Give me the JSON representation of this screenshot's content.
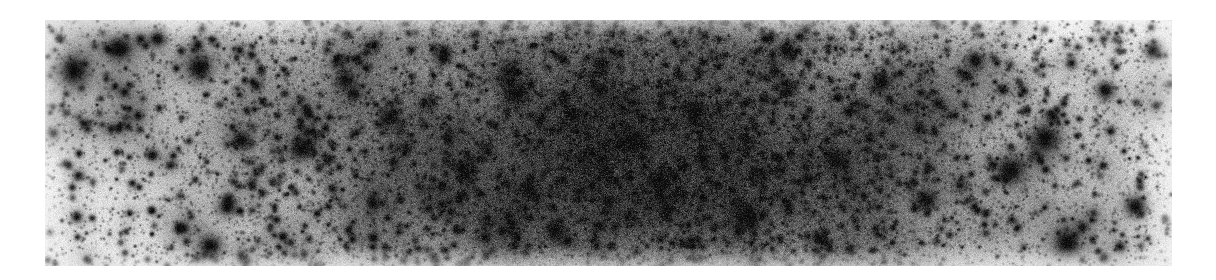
{
  "page": {
    "background_color": "#ffffff",
    "width": 1216,
    "height": 280
  },
  "figure": {
    "name": "dense-star-field-cutout",
    "description": "Inverted greyscale astronomical image of a dense stellar field (globular cluster / crowded Milky Way field). Dark points on a light background.",
    "frame": {
      "x": 45,
      "y": 20,
      "width": 1127,
      "height": 246
    },
    "polarity": "inverted-greyscale",
    "background_color_light": "#ededea",
    "background_color_dense": "#a8a8a6",
    "star_color": "#101010",
    "edge_color": "#ffffff",
    "caption": "",
    "axis_labels": [],
    "tick_labels": [],
    "legend": [],
    "annotations": []
  },
  "chart_data": {
    "type": "heatmap",
    "title": "",
    "xlabel": "",
    "ylabel": "",
    "grid": false,
    "legend_position": "none",
    "xlim": [
      0,
      1127
    ],
    "ylim": [
      0,
      246
    ],
    "density_profile_x": {
      "x_positions": [
        0,
        80,
        160,
        240,
        320,
        400,
        480,
        560,
        640,
        720,
        800,
        880,
        960,
        1040,
        1127
      ],
      "relative_density": [
        0.3,
        0.36,
        0.45,
        0.56,
        0.68,
        0.8,
        0.92,
        0.99,
        1.0,
        0.94,
        0.84,
        0.7,
        0.55,
        0.42,
        0.33
      ]
    },
    "density_profile_y": {
      "y_positions": [
        0,
        40,
        80,
        123,
        160,
        205,
        246
      ],
      "relative_density": [
        0.82,
        0.92,
        0.99,
        1.0,
        0.97,
        0.9,
        0.8
      ]
    },
    "noise_grain": {
      "faint_star_count": 19000,
      "mid_star_count": 2400,
      "bright_star_count": 150,
      "radius_range_px": [
        0.5,
        9.0
      ],
      "value_range": [
        0.08,
        1.0
      ]
    },
    "bright_stars": [
      {
        "x": 28,
        "y": 50,
        "radius": 7.5,
        "halo": 22,
        "spikes": true
      },
      {
        "x": 75,
        "y": 28,
        "radius": 5.2,
        "halo": 15,
        "spikes": false
      },
      {
        "x": 112,
        "y": 18,
        "radius": 4.0,
        "halo": 11,
        "spikes": false
      },
      {
        "x": 154,
        "y": 47,
        "radius": 6.2,
        "halo": 18,
        "spikes": true
      },
      {
        "x": 196,
        "y": 120,
        "radius": 4.6,
        "halo": 13,
        "spikes": false
      },
      {
        "x": 256,
        "y": 128,
        "radius": 5.8,
        "halo": 16,
        "spikes": true
      },
      {
        "x": 182,
        "y": 186,
        "radius": 4.2,
        "halo": 12,
        "spikes": false
      },
      {
        "x": 165,
        "y": 226,
        "radius": 5.6,
        "halo": 16,
        "spikes": true
      },
      {
        "x": 300,
        "y": 60,
        "radius": 4.4,
        "halo": 12,
        "spikes": false
      },
      {
        "x": 344,
        "y": 98,
        "radius": 5.0,
        "halo": 14,
        "spikes": false
      },
      {
        "x": 398,
        "y": 36,
        "radius": 4.2,
        "halo": 11,
        "spikes": false
      },
      {
        "x": 420,
        "y": 150,
        "radius": 4.8,
        "halo": 13,
        "spikes": false
      },
      {
        "x": 470,
        "y": 74,
        "radius": 5.4,
        "halo": 15,
        "spikes": true
      },
      {
        "x": 510,
        "y": 210,
        "radius": 4.6,
        "halo": 12,
        "spikes": false
      },
      {
        "x": 556,
        "y": 44,
        "radius": 4.0,
        "halo": 11,
        "spikes": false
      },
      {
        "x": 588,
        "y": 122,
        "radius": 6.0,
        "halo": 17,
        "spikes": true
      },
      {
        "x": 612,
        "y": 160,
        "radius": 4.5,
        "halo": 12,
        "spikes": false
      },
      {
        "x": 650,
        "y": 90,
        "radius": 5.2,
        "halo": 14,
        "spikes": false
      },
      {
        "x": 700,
        "y": 196,
        "radius": 6.4,
        "halo": 19,
        "spikes": true
      },
      {
        "x": 742,
        "y": 30,
        "radius": 4.2,
        "halo": 11,
        "spikes": false
      },
      {
        "x": 790,
        "y": 140,
        "radius": 5.0,
        "halo": 14,
        "spikes": false
      },
      {
        "x": 836,
        "y": 62,
        "radius": 4.6,
        "halo": 12,
        "spikes": false
      },
      {
        "x": 880,
        "y": 180,
        "radius": 5.4,
        "halo": 15,
        "spikes": true
      },
      {
        "x": 930,
        "y": 40,
        "radius": 4.2,
        "halo": 11,
        "spikes": false
      },
      {
        "x": 965,
        "y": 150,
        "radius": 6.8,
        "halo": 20,
        "spikes": true
      },
      {
        "x": 1000,
        "y": 118,
        "radius": 7.2,
        "halo": 21,
        "spikes": true
      },
      {
        "x": 1022,
        "y": 222,
        "radius": 6.6,
        "halo": 19,
        "spikes": true
      },
      {
        "x": 1060,
        "y": 70,
        "radius": 4.4,
        "halo": 12,
        "spikes": false
      },
      {
        "x": 1090,
        "y": 186,
        "radius": 5.0,
        "halo": 14,
        "spikes": false
      },
      {
        "x": 1108,
        "y": 30,
        "radius": 4.0,
        "halo": 10,
        "spikes": false
      }
    ]
  }
}
